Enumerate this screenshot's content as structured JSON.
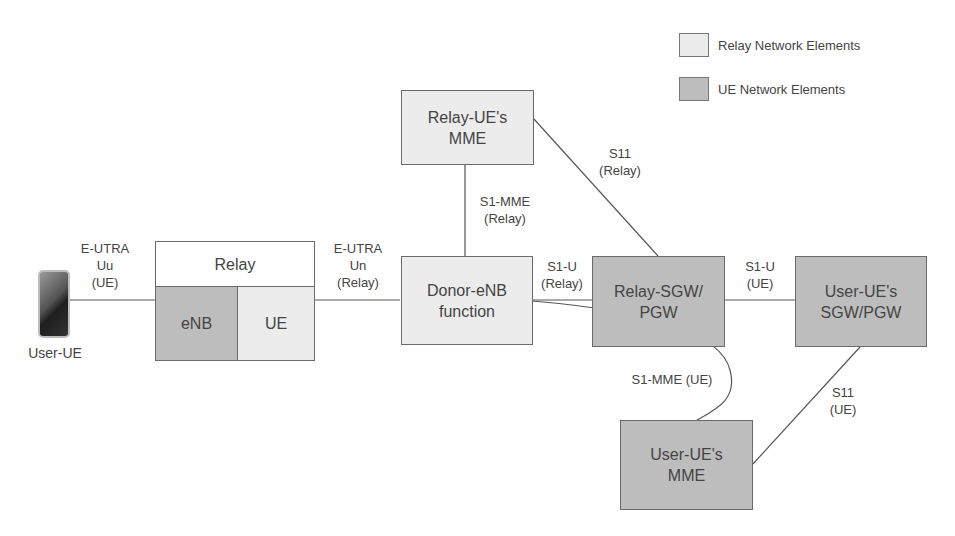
{
  "legend": {
    "items": [
      {
        "label": "Relay Network Elements",
        "color": "#ececec"
      },
      {
        "label": "UE Network Elements",
        "color": "#bdbdbd"
      }
    ]
  },
  "nodes": {
    "user_ue": {
      "label": "User-UE"
    },
    "relay": {
      "label": "Relay",
      "enb": "eNB",
      "ue": "UE"
    },
    "relay_ue_mme": {
      "label": "Relay-UE's\nMME"
    },
    "donor_enb": {
      "label": "Donor-eNB\nfunction"
    },
    "relay_sgw_pgw": {
      "label": "Relay-SGW/\nPGW"
    },
    "user_ue_sgw_pgw": {
      "label": "User-UE's\nSGW/PGW"
    },
    "user_ue_mme": {
      "label": "User-UE's\nMME"
    }
  },
  "interfaces": {
    "uu": "E-UTRA\nUu\n(UE)",
    "un": "E-UTRA\nUn\n(Relay)",
    "s1_mme_relay": "S1-MME\n(Relay)",
    "s11_relay": "S11\n(Relay)",
    "s1u_relay": "S1-U\n(Relay)",
    "s1u_ue": "S1-U\n(UE)",
    "s1_mme_ue": "S1-MME (UE)",
    "s11_ue": "S11\n(UE)"
  }
}
